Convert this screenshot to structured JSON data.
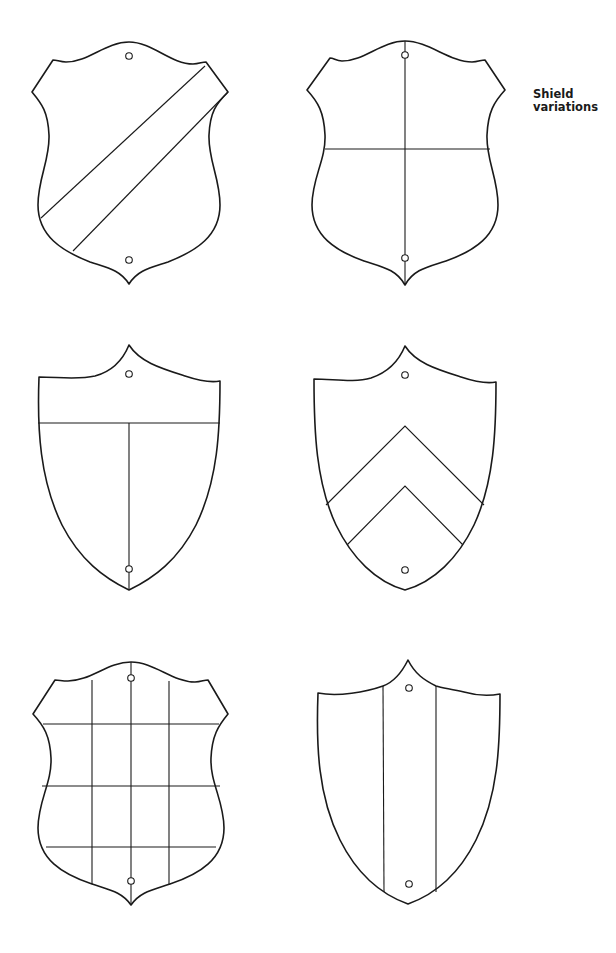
{
  "title": {
    "line1": "Shield",
    "line2": "variations"
  },
  "colors": {
    "stroke": "#1a1a1a",
    "background": "#ffffff"
  },
  "shields": [
    {
      "id": 1,
      "position": "top-left",
      "shape": "scalloped-eared",
      "division": "bend (diagonal band)",
      "holes": 2
    },
    {
      "id": 2,
      "position": "top-right",
      "shape": "scalloped-eared",
      "division": "quarterly (cross)",
      "holes": 2
    },
    {
      "id": 3,
      "position": "middle-left",
      "shape": "pointed-top heater",
      "division": "chief with pale below (T)",
      "holes": 2
    },
    {
      "id": 4,
      "position": "middle-right",
      "shape": "pointed-top heater",
      "division": "two chevrons",
      "holes": 2
    },
    {
      "id": 5,
      "position": "bottom-left",
      "shape": "scalloped-eared",
      "division": "checky grid (4x4)",
      "holes": 2
    },
    {
      "id": 6,
      "position": "bottom-right",
      "shape": "pointed-top heater",
      "division": "pale (vertical band)",
      "holes": 2
    }
  ]
}
